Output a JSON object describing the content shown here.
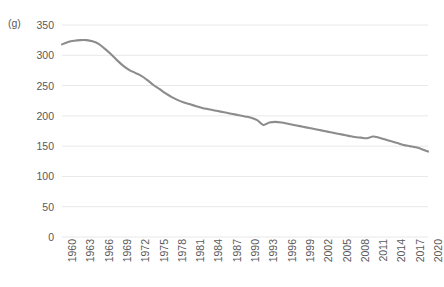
{
  "chart_data": {
    "type": "line",
    "title": "",
    "subtitle": "",
    "xlabel": "",
    "ylabel": "",
    "unit_label": "(g)",
    "grid": true,
    "legend": false,
    "legend_position": "none",
    "line_color": "#8c8c8c",
    "grid_color": "#e8e8e8",
    "text_color": "#595959",
    "background": "#ffffff",
    "xlim": [
      1960,
      2020
    ],
    "ylim": [
      0,
      350
    ],
    "y_ticks": [
      0,
      50,
      100,
      150,
      200,
      250,
      300,
      350
    ],
    "x_tick_labels": [
      "1960",
      "1963",
      "1966",
      "1969",
      "1972",
      "1975",
      "1978",
      "1981",
      "1984",
      "1987",
      "1990",
      "1993",
      "1996",
      "1999",
      "2002",
      "2005",
      "2008",
      "2011",
      "2014",
      "2017",
      "2020"
    ],
    "x_tick_step": 3,
    "x": [
      1960,
      1961,
      1962,
      1963,
      1964,
      1965,
      1966,
      1967,
      1968,
      1969,
      1970,
      1971,
      1972,
      1973,
      1974,
      1975,
      1976,
      1977,
      1978,
      1979,
      1980,
      1981,
      1982,
      1983,
      1984,
      1985,
      1986,
      1987,
      1988,
      1989,
      1990,
      1991,
      1992,
      1993,
      1994,
      1995,
      1996,
      1997,
      1998,
      1999,
      2000,
      2001,
      2002,
      2003,
      2004,
      2005,
      2006,
      2007,
      2008,
      2009,
      2010,
      2011,
      2012,
      2013,
      2014,
      2015,
      2016,
      2017,
      2018,
      2019,
      2020
    ],
    "values": [
      318,
      322,
      324,
      325,
      325,
      323,
      319,
      311,
      302,
      292,
      283,
      276,
      271,
      266,
      259,
      251,
      244,
      237,
      231,
      226,
      222,
      219,
      216,
      213,
      211,
      209,
      207,
      205,
      203,
      201,
      199,
      197,
      193,
      185,
      189,
      190,
      189,
      187,
      185,
      183,
      181,
      179,
      177,
      175,
      173,
      171,
      169,
      167,
      165,
      164,
      163,
      166,
      164,
      161,
      158,
      155,
      152,
      150,
      148,
      145,
      141
    ],
    "series": [
      {
        "name": "series-1",
        "values": [
          318,
          322,
          324,
          325,
          325,
          323,
          319,
          311,
          302,
          292,
          283,
          276,
          271,
          266,
          259,
          251,
          244,
          237,
          231,
          226,
          222,
          219,
          216,
          213,
          211,
          209,
          207,
          205,
          203,
          201,
          199,
          197,
          193,
          185,
          189,
          190,
          189,
          187,
          185,
          183,
          181,
          179,
          177,
          175,
          173,
          171,
          169,
          167,
          165,
          164,
          163,
          166,
          164,
          161,
          158,
          155,
          152,
          150,
          148,
          145,
          141
        ]
      }
    ],
    "notes": {
      "peak_year": 1963,
      "peak_value": 325,
      "dip_year": 1993,
      "dip_value": 185,
      "bump_year": 2011,
      "bump_value": 166,
      "end_year": 2020,
      "end_value": 141
    }
  }
}
